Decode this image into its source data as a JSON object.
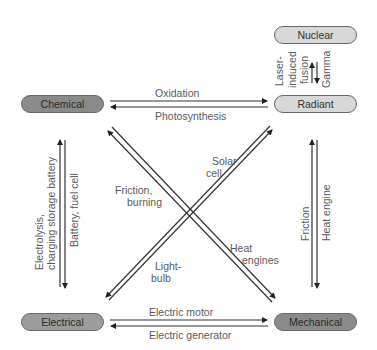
{
  "nodes": {
    "nuclear": "Nuclear",
    "radiant": "Radiant",
    "chemical": "Chemical",
    "electrical": "Electrical",
    "mechanical": "Mechanical"
  },
  "edges": {
    "chemical_to_radiant": "Oxidation",
    "radiant_to_chemical": "Photosynthesis",
    "electrical_to_mechanical": "Electric motor",
    "mechanical_to_electrical": "Electric generator",
    "electrical_to_chemical_line1": "Electrolysis,",
    "electrical_to_chemical_line2": "charging storage battery",
    "chemical_to_electrical": "Battery, fuel cell",
    "mechanical_to_radiant": "Friction",
    "radiant_to_mechanical": "Heat engine",
    "radiant_to_nuclear_line1": "Laser-",
    "radiant_to_nuclear_line2": "induced",
    "radiant_to_nuclear_line3": "fusion",
    "nuclear_to_radiant": "Gamma",
    "mechanical_to_chemical_line1": "Friction,",
    "mechanical_to_chemical_line2": "burning",
    "chemical_to_mechanical_line1": "Heat",
    "chemical_to_mechanical_line2": "engines",
    "electrical_to_radiant_line1": "Solar",
    "electrical_to_radiant_line2": "cell",
    "radiant_to_electrical_line1": "Light-",
    "radiant_to_electrical_line2": "bulb"
  }
}
